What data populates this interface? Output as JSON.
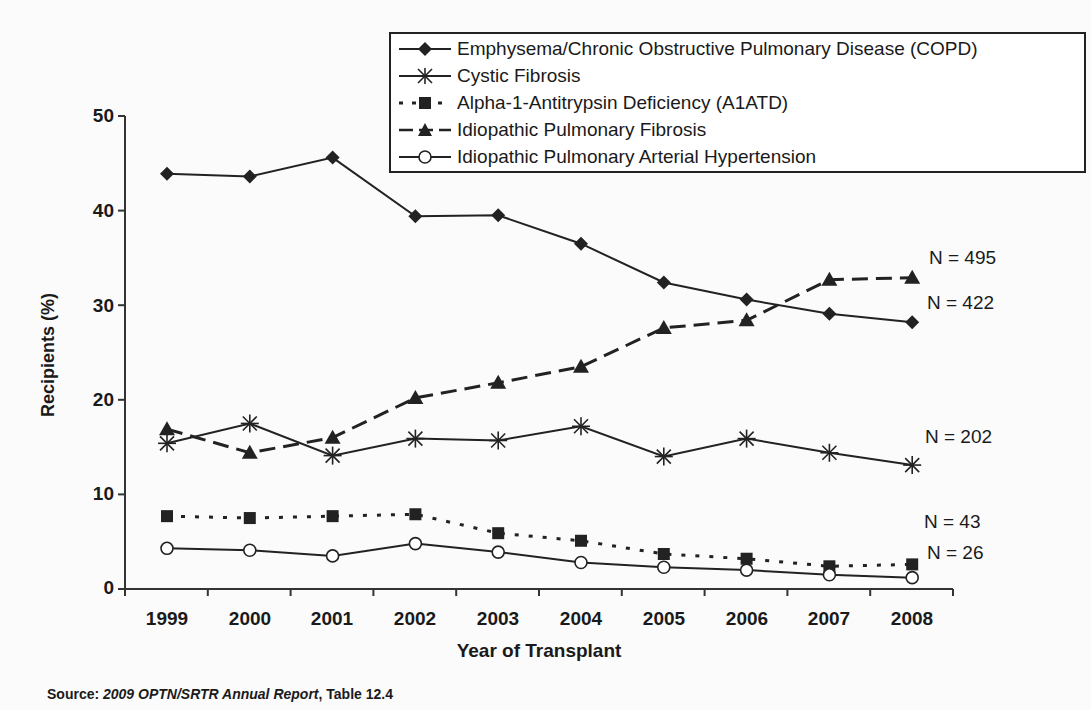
{
  "chart_data": {
    "type": "line",
    "title": "",
    "xlabel": "Year of Transplant",
    "ylabel": "Recipients (%)",
    "ylim": [
      0,
      50
    ],
    "yticks": [
      0,
      10,
      20,
      30,
      40,
      50
    ],
    "x": [
      1999,
      2000,
      2001,
      2002,
      2003,
      2004,
      2005,
      2006,
      2007,
      2008
    ],
    "grid": false,
    "legend_position": "top-right, boxed",
    "series": [
      {
        "name": "Emphysema/Chronic Obstructive Pulmonary Disease (COPD)",
        "marker": "diamond",
        "line": "solid",
        "values": [
          43.9,
          43.6,
          45.6,
          39.4,
          39.5,
          36.5,
          32.4,
          30.6,
          29.1,
          28.2
        ],
        "end_label": "N = 422"
      },
      {
        "name": "Cystic Fibrosis",
        "marker": "asterisk",
        "line": "solid",
        "values": [
          15.4,
          17.5,
          14.1,
          15.9,
          15.7,
          17.2,
          14.0,
          15.9,
          14.4,
          13.1
        ],
        "end_label": "N = 202"
      },
      {
        "name": "Alpha-1-Antitrypsin Deficiency (A1ATD)",
        "marker": "square",
        "line": "dotted",
        "values": [
          7.7,
          7.5,
          7.7,
          7.9,
          5.9,
          5.1,
          3.7,
          3.2,
          2.4,
          2.6
        ],
        "end_label": "N = 43"
      },
      {
        "name": "Idiopathic Pulmonary Fibrosis",
        "marker": "triangle",
        "line": "dashed",
        "values": [
          16.9,
          14.4,
          16.0,
          20.2,
          21.8,
          23.5,
          27.6,
          28.4,
          32.7,
          32.9
        ],
        "end_label": "N = 495"
      },
      {
        "name": "Idiopathic Pulmonary Arterial Hypertension",
        "marker": "circle",
        "line": "solid",
        "values": [
          4.3,
          4.1,
          3.5,
          4.8,
          3.9,
          2.8,
          2.3,
          2.0,
          1.5,
          1.2
        ],
        "end_label": "N = 26"
      }
    ],
    "annotations": [
      "N = 495",
      "N = 422",
      "N = 202",
      "N = 43",
      "N = 26"
    ],
    "source": "Source: 2009 OPTN/SRTR Annual Report, Table 12.4"
  },
  "labels": {
    "ylabel": "Recipients (%)",
    "xlabel": "Year of Transplant",
    "source_prefix": "Source: ",
    "source_title": "2009 OPTN/SRTR Annual Report",
    "source_suffix": ", Table 12.4",
    "yticks": [
      "0",
      "10",
      "20",
      "30",
      "40",
      "50"
    ],
    "xticks": [
      "1999",
      "2000",
      "2001",
      "2002",
      "2003",
      "2004",
      "2005",
      "2006",
      "2007",
      "2008"
    ],
    "legend": [
      "Emphysema/Chronic Obstructive Pulmonary Disease (COPD)",
      "Cystic Fibrosis",
      "Alpha-1-Antitrypsin Deficiency (A1ATD)",
      "Idiopathic Pulmonary Fibrosis",
      "Idiopathic Pulmonary Arterial Hypertension"
    ],
    "n_labels": [
      "N = 495",
      "N = 422",
      "N = 202",
      "N = 43",
      "N = 26"
    ]
  }
}
